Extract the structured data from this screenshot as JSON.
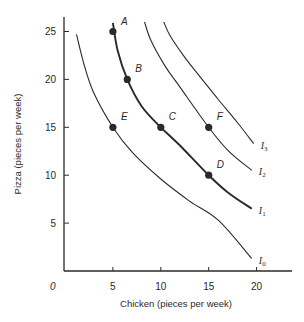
{
  "chart_data": {
    "type": "line",
    "title": "",
    "xlabel": "Chicken (pieces per week)",
    "ylabel": "Pizza (pieces per week)",
    "origin_label": "0",
    "xlim": [
      0,
      23
    ],
    "ylim": [
      0,
      26
    ],
    "x_ticks": [
      5,
      10,
      15,
      20
    ],
    "y_ticks": [
      5,
      10,
      15,
      20,
      25
    ],
    "grid": false,
    "legend": "none (curves labeled inline at right end)",
    "series": [
      {
        "name": "I0",
        "label_main": "I",
        "label_sub": "0",
        "emphasis": false,
        "points": [
          [
            1.2,
            24.7
          ],
          [
            2,
            21.5
          ],
          [
            3,
            18.6
          ],
          [
            5,
            15
          ],
          [
            7,
            12.4
          ],
          [
            10,
            9.6
          ],
          [
            13,
            7.3
          ],
          [
            16,
            5.3
          ],
          [
            19.5,
            1.3
          ]
        ]
      },
      {
        "name": "I1",
        "label_main": "I",
        "label_sub": "1",
        "emphasis": true,
        "points": [
          [
            5,
            25.9
          ],
          [
            5.5,
            23
          ],
          [
            6.5,
            20
          ],
          [
            8,
            17.2
          ],
          [
            10,
            15
          ],
          [
            12,
            13.1
          ],
          [
            15,
            10
          ],
          [
            17,
            8.2
          ],
          [
            19.5,
            6.5
          ]
        ]
      },
      {
        "name": "I2",
        "label_main": "I",
        "label_sub": "2",
        "emphasis": false,
        "points": [
          [
            8.3,
            26
          ],
          [
            9,
            24
          ],
          [
            10.5,
            21.3
          ],
          [
            12,
            19.2
          ],
          [
            15,
            15
          ],
          [
            17,
            12.6
          ],
          [
            19.5,
            10.5
          ]
        ]
      },
      {
        "name": "I3",
        "label_main": "I",
        "label_sub": "3",
        "emphasis": false,
        "points": [
          [
            10.3,
            26
          ],
          [
            11,
            24.5
          ],
          [
            12.5,
            22.3
          ],
          [
            14,
            20.4
          ],
          [
            16,
            17.9
          ],
          [
            18,
            15.5
          ],
          [
            19.7,
            13.3
          ]
        ]
      }
    ],
    "marked_points": [
      {
        "label": "A",
        "x": 5,
        "y": 25,
        "curve": "I1"
      },
      {
        "label": "B",
        "x": 6.5,
        "y": 20,
        "curve": "I1"
      },
      {
        "label": "C",
        "x": 10,
        "y": 15,
        "curve": "I1"
      },
      {
        "label": "D",
        "x": 15,
        "y": 10,
        "curve": "I1"
      },
      {
        "label": "E",
        "x": 5,
        "y": 15,
        "curve": "I0"
      },
      {
        "label": "F",
        "x": 15,
        "y": 15,
        "curve": "I2"
      }
    ]
  },
  "colors": {
    "ink": "#2a2a2a",
    "background": "#ffffff"
  }
}
